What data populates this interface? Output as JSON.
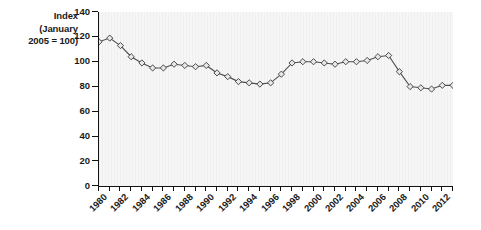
{
  "axis_title": {
    "line1": "Index",
    "line2": "(January",
    "line3": "2005 = 100)"
  },
  "colors": {
    "line": "#4d4d4d",
    "marker_fill": "#e8e8e8",
    "marker_stroke": "#3a3a3a",
    "axis": "#111111",
    "plot_background": "#f2f2f2",
    "text": "#1a1a1a"
  },
  "chart_data": {
    "type": "line",
    "title": "",
    "subtitle": "",
    "xlabel": "",
    "ylabel": "Index (January 2005 = 100)",
    "ylim": [
      0,
      140
    ],
    "ytick_values": [
      0,
      20,
      40,
      60,
      80,
      100,
      120,
      140
    ],
    "ytick_labels": [
      "0",
      "20",
      "40",
      "60",
      "80",
      "100",
      "120",
      "140"
    ],
    "xlim": [
      1980,
      2013
    ],
    "xtick_labels": [
      "1980",
      "1982",
      "1984",
      "1986",
      "1988",
      "1990",
      "1992",
      "1994",
      "1996",
      "1998",
      "2000",
      "2002",
      "2004",
      "2006",
      "2008",
      "2010",
      "2012"
    ],
    "xtick_step": 2,
    "minor_xticks_every": 1,
    "grid": false,
    "legend": "none",
    "marker": "diamond",
    "x": [
      1980,
      1981,
      1982,
      1983,
      1984,
      1985,
      1986,
      1987,
      1988,
      1989,
      1990,
      1991,
      1992,
      1993,
      1994,
      1995,
      1996,
      1997,
      1998,
      1999,
      2000,
      2001,
      2002,
      2003,
      2004,
      2005,
      2006,
      2007,
      2008,
      2009,
      2010,
      2011,
      2012,
      2013
    ],
    "values": [
      116,
      119,
      113,
      104,
      99,
      95,
      95,
      98,
      97,
      96,
      97,
      91,
      88,
      84,
      83,
      82,
      83,
      90,
      99,
      100,
      100,
      99,
      98,
      100,
      100,
      101,
      104,
      105,
      92,
      80,
      79,
      78,
      81,
      81
    ],
    "series": [
      {
        "name": "Index (January 2005 = 100)",
        "values": [
          116,
          119,
          113,
          104,
          99,
          95,
          95,
          98,
          97,
          96,
          97,
          91,
          88,
          84,
          83,
          82,
          83,
          90,
          99,
          100,
          100,
          99,
          98,
          100,
          100,
          101,
          104,
          105,
          92,
          80,
          79,
          78,
          81,
          81
        ]
      }
    ]
  }
}
